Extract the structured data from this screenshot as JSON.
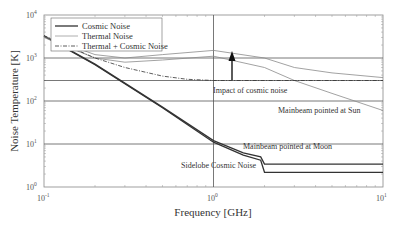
{
  "chart_data": {
    "type": "line",
    "title": "",
    "xlabel": "Frequency [GHz]",
    "ylabel": "Noise Temperature [K]",
    "xscale": "log",
    "yscale": "log",
    "xlim": [
      0.1,
      10
    ],
    "ylim": [
      1,
      10000
    ],
    "xticks": [
      {
        "value": 0.1,
        "base": "10",
        "exp": "-1"
      },
      {
        "value": 1,
        "base": "10",
        "exp": "0"
      },
      {
        "value": 10,
        "base": "10",
        "exp": "1"
      }
    ],
    "yticks": [
      {
        "value": 1,
        "base": "10",
        "exp": "0"
      },
      {
        "value": 10,
        "base": "10",
        "exp": "1"
      },
      {
        "value": 100,
        "base": "10",
        "exp": "2"
      },
      {
        "value": 1000,
        "base": "10",
        "exp": "3"
      },
      {
        "value": 10000,
        "base": "10",
        "exp": "4"
      }
    ],
    "grid": "major (horizontal reference lines at 10, 100, 300, 1000; vertical at 1 GHz)",
    "legend": {
      "position": "upper left",
      "entries": [
        {
          "label": "Cosmic Noise",
          "style": "solid-dark"
        },
        {
          "label": "Thermal Noise",
          "style": "solid-light"
        },
        {
          "label": "Thermal + Cosmic Noise",
          "style": "dash-dot"
        }
      ]
    },
    "series": [
      {
        "name": "Cosmic Noise (Sidelobe)",
        "style": "solid-dark",
        "x": [
          0.1,
          0.2,
          0.5,
          1.0,
          1.5,
          1.9,
          2.0,
          10
        ],
        "y": [
          3200,
          700,
          70,
          11,
          5.5,
          4.2,
          2.2,
          2.2
        ]
      },
      {
        "name": "Cosmic Noise (Mainbeam pointed at Moon)",
        "style": "solid-dark",
        "x": [
          0.1,
          0.2,
          0.5,
          1.0,
          1.5,
          1.9,
          2.0,
          10
        ],
        "y": [
          3300,
          720,
          72,
          12,
          6.2,
          5.0,
          3.4,
          3.4
        ]
      },
      {
        "name": "Thermal Noise (Mainbeam pointed at Sun)",
        "style": "solid-light",
        "x": [
          0.1,
          0.2,
          0.3,
          0.5,
          1.0,
          2.0,
          3.0,
          5.0,
          10
        ],
        "y": [
          3000,
          1000,
          800,
          900,
          1100,
          600,
          300,
          150,
          60
        ]
      },
      {
        "name": "Thermal + Cosmic Noise (Mainbeam pointed at Sun)",
        "style": "solid-light",
        "x": [
          0.1,
          0.2,
          0.3,
          0.5,
          1.0,
          2.0,
          3.0,
          5.0,
          10
        ],
        "y": [
          3200,
          1200,
          1000,
          1200,
          1500,
          1000,
          600,
          450,
          350
        ]
      },
      {
        "name": "Thermal + Cosmic Noise",
        "style": "dash-dot",
        "x": [
          0.1,
          0.2,
          0.3,
          0.5,
          0.7,
          1.0,
          2.0,
          10
        ],
        "y": [
          3300,
          1000,
          600,
          380,
          320,
          300,
          300,
          300
        ]
      }
    ],
    "annotations": [
      {
        "text": "Impact of cosmic noise",
        "type": "arrow",
        "x": 1.2,
        "from_y": 300,
        "to_y": 1400
      },
      {
        "text": "Mainbeam pointed at Sun",
        "x": 4.0,
        "y": 65
      },
      {
        "text": "Mainbeam pointed at Moon",
        "x": 2.0,
        "y": 8
      },
      {
        "text": "Sidelobe Cosmic Noise",
        "x": 0.8,
        "y": 4
      }
    ]
  },
  "axes": {
    "xlabel": "Frequency [GHz]",
    "ylabel": "Noise Temperature [K]"
  },
  "legend": {
    "items": [
      {
        "label": "Cosmic Noise"
      },
      {
        "label": "Thermal Noise"
      },
      {
        "label": "Thermal + Cosmic Noise"
      }
    ]
  },
  "annotations": {
    "impact": "Impact of cosmic noise",
    "sun": "Mainbeam pointed at Sun",
    "moon": "Mainbeam pointed at Moon",
    "sidelobe": "Sidelobe Cosmic Noise"
  },
  "ticks": {
    "x": [
      {
        "base": "10",
        "exp": "-1"
      },
      {
        "base": "10",
        "exp": "0"
      },
      {
        "base": "10",
        "exp": "1"
      }
    ],
    "y": [
      {
        "base": "10",
        "exp": "0"
      },
      {
        "base": "10",
        "exp": "1"
      },
      {
        "base": "10",
        "exp": "2"
      },
      {
        "base": "10",
        "exp": "3"
      },
      {
        "base": "10",
        "exp": "4"
      }
    ]
  },
  "colors": {
    "dark_line": "#333333",
    "light_line": "#8a8a8a",
    "grid": "#555555",
    "axis": "#777777"
  }
}
